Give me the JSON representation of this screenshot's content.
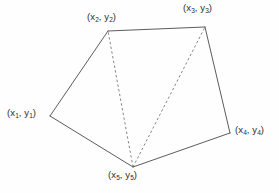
{
  "figure": {
    "background_color": "#fefefe",
    "solid_line_color": "#4a4a4a",
    "dashed_line_color": "#6e6e6e",
    "label_color": "#2e2e2e",
    "vertices": [
      {
        "id": "v1",
        "name": "x1y1",
        "x": 50,
        "y": 116,
        "label_x": "x",
        "label_sub": "1",
        "label_y": "y",
        "label_full": "(x1, y1)"
      },
      {
        "id": "v2",
        "name": "x2y2",
        "x": 108,
        "y": 31,
        "label_x": "x",
        "label_sub": "2",
        "label_y": "y",
        "label_full": "(x2, y2)"
      },
      {
        "id": "v3",
        "name": "x3y3",
        "x": 205,
        "y": 27,
        "label_x": "x",
        "label_sub": "3",
        "label_y": "y",
        "label_full": "(x3, y3)"
      },
      {
        "id": "v4",
        "name": "x4y4",
        "x": 230,
        "y": 133,
        "label_x": "x",
        "label_sub": "4",
        "label_y": "y",
        "label_full": "(x4, y4)"
      },
      {
        "id": "v5",
        "name": "x5y5",
        "x": 133,
        "y": 167,
        "label_x": "x",
        "label_sub": "5",
        "label_y": "y",
        "label_full": "(x5, y5)"
      }
    ],
    "solid_edges": [
      {
        "from": "v1",
        "to": "v2"
      },
      {
        "from": "v2",
        "to": "v3"
      },
      {
        "from": "v3",
        "to": "v4"
      },
      {
        "from": "v4",
        "to": "v5"
      },
      {
        "from": "v5",
        "to": "v1"
      }
    ],
    "dashed_edges": [
      {
        "from": "v5",
        "to": "v2"
      },
      {
        "from": "v5",
        "to": "v3"
      }
    ]
  },
  "labels": {
    "v1": {
      "open": "(x",
      "sub1": "1",
      "mid": ", y",
      "sub2": "1",
      "close": ")"
    },
    "v2": {
      "open": "(x",
      "sub1": "2",
      "mid": ", y",
      "sub2": "2",
      "close": ")"
    },
    "v3": {
      "open": "(x",
      "sub1": "3",
      "mid": ", y",
      "sub2": "3",
      "close": ")"
    },
    "v4": {
      "open": "(x",
      "sub1": "4",
      "mid": ", y",
      "sub2": "4",
      "close": ")"
    },
    "v5": {
      "open": "(x",
      "sub1": "5",
      "mid": ", y",
      "sub2": "5",
      "close": ")"
    }
  }
}
